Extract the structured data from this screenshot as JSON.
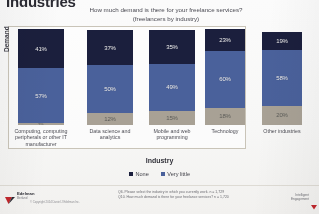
{
  "slide": {
    "title": "Industries",
    "question_line1": "How much demand is there for your freelance services?",
    "question_line2": "(freelancers by industry)",
    "ylabel": "Demand",
    "xlabel": "Industry",
    "footnote_line1": "Q6. Please select the industry in which you currently work. n = 1,729",
    "footnote_line2": "Q10. How much demand is there for your freelance services? n = 1,720",
    "logo_name": "Edelman",
    "logo_sub": "Berland",
    "copyright": "© Copyright 2014 Daniel J Edelman Inc.",
    "corner_line1": "Intelligent",
    "corner_line2": "Engagement"
  },
  "colors": {
    "none": "#1b1f3d",
    "very_little": "#4a619b",
    "some": "#a8a195",
    "frame": "#c9c4b8"
  },
  "chart_data": {
    "type": "bar",
    "subtype": "stacked-bar",
    "title": "How much demand is there for your freelance services? (freelancers by industry)",
    "xlabel": "Industry",
    "ylabel": "Demand",
    "ylim": [
      0,
      100
    ],
    "grid": false,
    "legend_position": "bottom",
    "categories": [
      "Computing, computing peripherals or other IT manufacturer",
      "Data science and analytics",
      "Mobile and web programming",
      "Technology",
      "Other industries"
    ],
    "series": [
      {
        "name": "None",
        "values": [
          41,
          37,
          35,
          23,
          19
        ]
      },
      {
        "name": "Very little",
        "values": [
          57,
          50,
          49,
          60,
          58
        ]
      },
      {
        "name": "Some",
        "values": [
          2,
          12,
          15,
          18,
          20
        ]
      }
    ],
    "bars": [
      {
        "category": "Computing, computing peripherals or other IT manufacturer",
        "segments": [
          {
            "label": "None",
            "value": 41,
            "display": "41%"
          },
          {
            "label": "Very little",
            "value": 57,
            "display": "57%"
          },
          {
            "label": "Some",
            "value": 2,
            "display": "2%"
          }
        ]
      },
      {
        "category": "Data science and analytics",
        "segments": [
          {
            "label": "None",
            "value": 37,
            "display": "37%"
          },
          {
            "label": "Very little",
            "value": 50,
            "display": "50%"
          },
          {
            "label": "Some",
            "value": 12,
            "display": "12%"
          }
        ]
      },
      {
        "category": "Mobile and web programming",
        "segments": [
          {
            "label": "None",
            "value": 35,
            "display": "35%"
          },
          {
            "label": "Very little",
            "value": 49,
            "display": "49%"
          },
          {
            "label": "Some",
            "value": 15,
            "display": "15%"
          }
        ]
      },
      {
        "category": "Technology",
        "segments": [
          {
            "label": "None",
            "value": 23,
            "display": "23%"
          },
          {
            "label": "Very little",
            "value": 60,
            "display": "60%"
          },
          {
            "label": "Some",
            "value": 18,
            "display": "18%"
          }
        ]
      },
      {
        "category": "Other industries",
        "segments": [
          {
            "label": "None",
            "value": 19,
            "display": "19%"
          },
          {
            "label": "Very little",
            "value": 58,
            "display": "58%"
          },
          {
            "label": "Some",
            "value": 20,
            "display": "20%"
          }
        ]
      }
    ],
    "category_labels": [
      [
        "Computing, computing",
        "peripherals or other IT",
        "manufacturer"
      ],
      [
        "Data science and",
        "analytics"
      ],
      [
        "Mobile and web",
        "programming"
      ],
      [
        "Technology"
      ],
      [
        "Other industries"
      ]
    ],
    "legend": [
      {
        "label": "None",
        "color": "#1b1f3d"
      },
      {
        "label": "Very little",
        "color": "#4a619b"
      }
    ]
  }
}
